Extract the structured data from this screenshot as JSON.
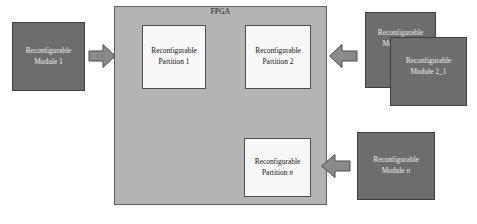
{
  "diagram": {
    "fpga": {
      "label": "FPGA",
      "fill": "#b4b4b4",
      "stroke": "#5e5e5e"
    },
    "partitions": [
      {
        "id": "partition-1",
        "line1": "Reconfigurable",
        "line2": "Partition 1",
        "italic_suffix": ""
      },
      {
        "id": "partition-2",
        "line1": "Reconfigurable",
        "line2": "Partition 2",
        "italic_suffix": ""
      },
      {
        "id": "partition-n",
        "line1": "Reconfigurable",
        "line2": "Partition ",
        "italic_suffix": "n"
      }
    ],
    "modules": [
      {
        "id": "module-1",
        "line1": "Reconfigurable",
        "line2": "Module 1",
        "italic_suffix": ""
      },
      {
        "id": "module-2-2",
        "line1": "Reconfigurable",
        "line2": "Module 2_2",
        "italic_suffix": ""
      },
      {
        "id": "module-2-1",
        "line1": "Reconfigurable",
        "line2": "Module 2_1",
        "italic_suffix": ""
      },
      {
        "id": "module-n",
        "line1": "Reconfigurable",
        "line2": "Module ",
        "italic_suffix": "n"
      }
    ],
    "arrows": [
      {
        "id": "arrow-1",
        "direction": "right",
        "icon": "block-arrow-right-icon"
      },
      {
        "id": "arrow-2",
        "direction": "left",
        "icon": "block-arrow-left-icon"
      },
      {
        "id": "arrow-n",
        "direction": "left",
        "icon": "block-arrow-left-icon"
      }
    ],
    "colors": {
      "module_fill": "#6d6d6d",
      "module_stroke": "#3f3f3f",
      "partition_fill": "#f8f8f8",
      "partition_stroke": "#4d4d4d",
      "fpga_fill": "#b4b4b4",
      "arrow_fill": "#8a8a8a",
      "arrow_stroke": "#4a4a4a",
      "background": "#ffffff"
    }
  }
}
